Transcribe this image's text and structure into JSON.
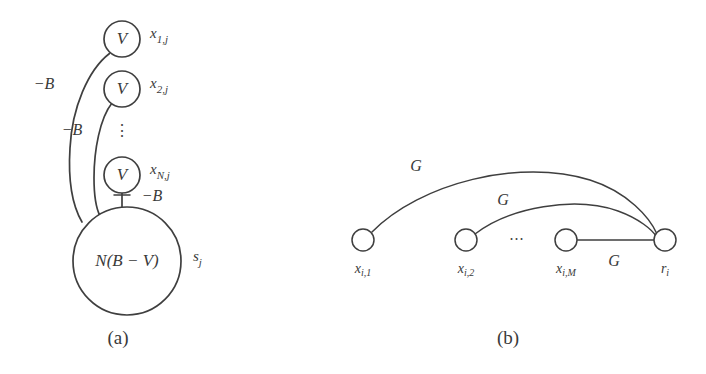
{
  "figure": {
    "background_color": "#ffffff",
    "ink_color": "#3f3f3f",
    "panels": [
      {
        "id": "panel-a",
        "caption": "(a)",
        "nodes": [
          {
            "id": "x1j",
            "inner_label": "V",
            "outer_label": "x",
            "sub": "1,j",
            "cx": 122,
            "cy": 39,
            "r": 18
          },
          {
            "id": "x2j",
            "inner_label": "V",
            "outer_label": "x",
            "sub": "2,j",
            "cx": 122,
            "cy": 89,
            "r": 18
          },
          {
            "id": "xNj",
            "inner_label": "V",
            "outer_label": "x",
            "sub": "N,j",
            "cx": 122,
            "cy": 175,
            "r": 18
          },
          {
            "id": "sj",
            "inner_label": "N(B − V)",
            "outer_label": "s",
            "sub": "j",
            "cx": 127,
            "cy": 261,
            "r": 54
          }
        ],
        "vertical_ellipsis": "⋮",
        "edges": [
          {
            "id": "edge-x1j-sj",
            "label": "−B",
            "from": "x1j",
            "to": "sj"
          },
          {
            "id": "edge-x2j-sj",
            "label": "−B",
            "from": "x2j",
            "to": "sj"
          },
          {
            "id": "edge-xNj-sj",
            "label": "−B",
            "from": "xNj",
            "to": "sj"
          }
        ]
      },
      {
        "id": "panel-b",
        "caption": "(b)",
        "nodes": [
          {
            "id": "xi1",
            "outer_label": "x",
            "sub": "i,1",
            "cx": 363,
            "cy": 240,
            "r": 11
          },
          {
            "id": "xi2",
            "outer_label": "x",
            "sub": "i,2",
            "cx": 466,
            "cy": 240,
            "r": 11
          },
          {
            "id": "xiM",
            "outer_label": "x",
            "sub": "i,M",
            "cx": 566,
            "cy": 240,
            "r": 11
          },
          {
            "id": "ri",
            "outer_label": "r",
            "sub": "i",
            "cx": 665,
            "cy": 240,
            "r": 11
          }
        ],
        "horizontal_ellipsis": "⋯",
        "edges": [
          {
            "id": "edge-xi1-ri",
            "label": "G",
            "from": "xi1",
            "to": "ri"
          },
          {
            "id": "edge-xi2-ri",
            "label": "G",
            "from": "xi2",
            "to": "ri"
          },
          {
            "id": "edge-xiM-ri",
            "label": "G",
            "from": "xiM",
            "to": "ri"
          }
        ]
      }
    ]
  }
}
